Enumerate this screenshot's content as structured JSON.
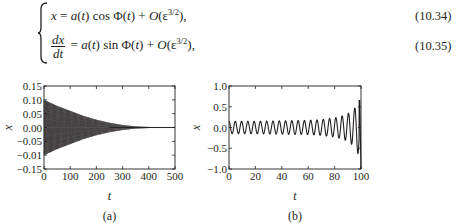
{
  "equations": [
    {
      "lhs": "x",
      "rhs_parts": [
        "a",
        "(",
        "t",
        ") cos Φ(",
        "t",
        ") + ",
        "O",
        "(ε",
        "3/2",
        "),"
      ],
      "number": "(10.34)"
    },
    {
      "lhs_num": "dx",
      "lhs_den": "dt",
      "rhs_parts": [
        "a",
        "(",
        "t",
        ") sin Φ(",
        "t",
        ") + ",
        "O",
        "(ε",
        "3/2",
        "),"
      ],
      "number": "(10.35)"
    }
  ],
  "chart_data": [
    {
      "type": "line",
      "panel_label": "(a)",
      "title": "",
      "xlabel": "t",
      "ylabel": "x",
      "xlim": [
        0,
        500
      ],
      "ylim": [
        -0.15,
        0.15
      ],
      "xticks": [
        "0",
        "100",
        "200",
        "300",
        "400",
        "500"
      ],
      "yticks": [
        "0.15",
        "0.10",
        "0.05",
        "0.00",
        "−0.05",
        "−0.01",
        "−0.15"
      ],
      "grid": false,
      "description": "Rapidly oscillating signal with decaying envelope",
      "envelope": {
        "t": [
          0,
          50,
          100,
          150,
          200,
          250,
          300,
          350,
          400,
          450,
          500
        ],
        "amplitude": [
          0.1,
          0.078,
          0.06,
          0.042,
          0.028,
          0.017,
          0.009,
          0.004,
          0.002,
          0.001,
          0.0005
        ]
      },
      "oscillation_cycles": 150
    },
    {
      "type": "line",
      "panel_label": "(b)",
      "title": "",
      "xlabel": "t",
      "ylabel": "x",
      "xlim": [
        0,
        100
      ],
      "ylim": [
        -1.0,
        1.0
      ],
      "xticks": [
        "0",
        "20",
        "40",
        "60",
        "80",
        "100"
      ],
      "yticks": [
        "1.0",
        "0.5",
        "0.0",
        "−0.5",
        "−1.0"
      ],
      "grid": false,
      "description": "Oscillation with slowly growing amplitude that blows up near t=100",
      "envelope": {
        "t": [
          0,
          20,
          40,
          60,
          70,
          80,
          85,
          90,
          95,
          98,
          100
        ],
        "amplitude": [
          0.15,
          0.15,
          0.16,
          0.17,
          0.19,
          0.23,
          0.27,
          0.33,
          0.45,
          0.65,
          1.0
        ]
      },
      "oscillation_cycles": 21
    }
  ]
}
